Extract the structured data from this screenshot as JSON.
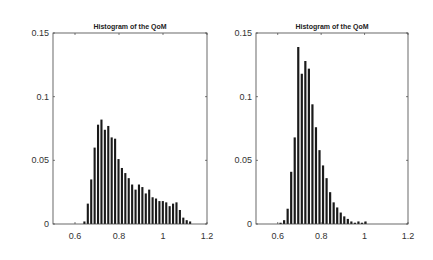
{
  "chart_data": [
    {
      "type": "bar",
      "title": "Histogram of the QoM",
      "xlabel": "",
      "ylabel": "",
      "xlim": [
        0.5,
        1.2
      ],
      "ylim": [
        0,
        0.15
      ],
      "xticks": [
        "0.6",
        "0.8",
        "1",
        "1.2"
      ],
      "yticks": [
        "0",
        "0.05",
        "0.1",
        "0.15"
      ],
      "grid": false,
      "bin_start": 0.635,
      "bin_width": 0.0155,
      "values": [
        0.002,
        0.016,
        0.035,
        0.06,
        0.078,
        0.082,
        0.074,
        0.077,
        0.068,
        0.067,
        0.051,
        0.044,
        0.04,
        0.036,
        0.031,
        0.027,
        0.031,
        0.029,
        0.024,
        0.027,
        0.021,
        0.02,
        0.018,
        0.018,
        0.017,
        0.014,
        0.016,
        0.017,
        0.011,
        0.005,
        0.003,
        0.002
      ],
      "bar_color": "#1a1a1a"
    },
    {
      "type": "bar",
      "title": "Histogram of the QoM",
      "xlabel": "",
      "ylabel": "",
      "xlim": [
        0.5,
        1.2
      ],
      "ylim": [
        0,
        0.15
      ],
      "xticks": [
        "0.6",
        "0.8",
        "1",
        "1.2"
      ],
      "yticks": [
        "0",
        "0.05",
        "0.1",
        "0.15"
      ],
      "grid": false,
      "bin_start": 0.605,
      "bin_width": 0.0163,
      "values": [
        0.001,
        0.003,
        0.012,
        0.041,
        0.068,
        0.139,
        0.118,
        0.128,
        0.122,
        0.094,
        0.076,
        0.058,
        0.046,
        0.036,
        0.025,
        0.017,
        0.013,
        0.009,
        0.006,
        0.004,
        0.002,
        0.001,
        0.002,
        0.001,
        0.002
      ],
      "bar_color": "#1a1a1a"
    }
  ]
}
